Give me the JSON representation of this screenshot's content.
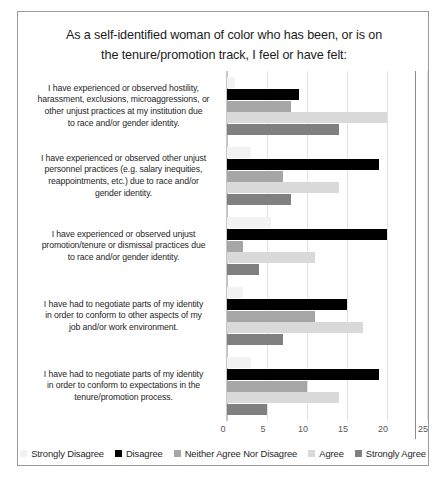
{
  "chart_data": {
    "type": "bar",
    "orientation": "horizontal",
    "title": "As a self-identified woman of color who has been, or is on the tenure/promotion  track, I feel or have felt:",
    "title_lines": [
      "As a self-identified woman of color who has been, or is on",
      "the tenure/promotion  track, I feel or have felt:"
    ],
    "xlabel": "",
    "ylabel": "",
    "xlim": [
      0,
      25
    ],
    "xticks": [
      0,
      5,
      10,
      15,
      20,
      25
    ],
    "xtick_labels": [
      "0",
      "5",
      "10",
      "15",
      "20",
      "25"
    ],
    "grid": true,
    "legend_position": "bottom",
    "categories": [
      "I have experienced or observed hostility, harassment, exclusions, microaggressions, or other unjust practices at my institution due to race and/or gender identity.",
      "I have experienced or observed other unjust personnel practices (e.g. salary inequities, reappointments, etc.) due to race and/or gender identity.",
      "I have experienced or observed unjust promotion/tenure or dismissal practices due to race and/or gender identity.",
      "I have had to negotiate parts of my identity in order to conform to other aspects of my job and/or work environment.",
      "I have had to negotiate parts of my identity in order to conform to expectations in the tenure/promotion process."
    ],
    "category_lines": [
      [
        "I have experienced or observed hostility,",
        "harassment, exclusions, microaggressions, or",
        "other unjust practices at my institution due",
        "to race and/or gender identity."
      ],
      [
        "I have experienced or observed other unjust",
        "personnel practices (e.g. salary inequities,",
        "reappointments, etc.) due to race and/or",
        "gender identity."
      ],
      [
        "I have experienced or observed unjust",
        "promotion/tenure or dismissal practices due",
        "to race and/or gender identity."
      ],
      [
        "I have had to negotiate parts of my identity",
        "in order to conform to other aspects of my",
        "job and/or work environment."
      ],
      [
        "I have had to negotiate parts of my identity",
        "in order to conform to expectations in the",
        "tenure/promotion process."
      ]
    ],
    "series": [
      {
        "name": "Strongly Disagree",
        "color": "#f2f2f2",
        "values": [
          1,
          3,
          5.5,
          2,
          3
        ]
      },
      {
        "name": "Disagree",
        "color": "#000000",
        "values": [
          9,
          19,
          20,
          15,
          19
        ]
      },
      {
        "name": "Neither Agree Nor Disagree",
        "color": "#a6a6a6",
        "values": [
          8,
          7,
          2,
          11,
          10
        ]
      },
      {
        "name": "Agree",
        "color": "#d9d9d9",
        "values": [
          20,
          14,
          11,
          17,
          14
        ]
      },
      {
        "name": "Strongly Agree",
        "color": "#808080",
        "values": [
          14,
          8,
          4,
          7,
          5
        ]
      }
    ]
  }
}
